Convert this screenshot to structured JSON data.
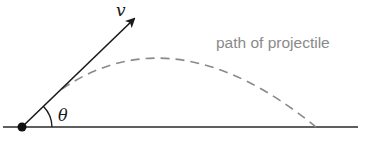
{
  "diagram": {
    "type": "projectile-motion",
    "labels": {
      "velocity": "v",
      "angle": "θ",
      "path": "path of projectile"
    },
    "colors": {
      "line": "#1a1a1a",
      "path": "#8a8a8a",
      "label": "#8a8a8a"
    }
  }
}
